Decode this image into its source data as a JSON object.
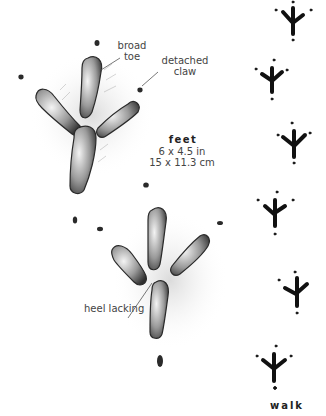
{
  "illustration": {
    "subject": "bird footprints",
    "annotations": {
      "broad_toe": [
        "broad",
        "toe"
      ],
      "detached_claw": [
        "detached",
        "claw"
      ],
      "heel_lacking": "heel lacking"
    },
    "feet": {
      "title": "feet",
      "size_in": "6 x 4.5 in",
      "size_cm": "15 x 11.3 cm"
    },
    "gait": {
      "label": "walk",
      "track_count": 6
    },
    "colors": {
      "background": "#ffffff",
      "ink": "#111111",
      "shading": "#8a8a8a",
      "label_text": "#444444"
    }
  }
}
